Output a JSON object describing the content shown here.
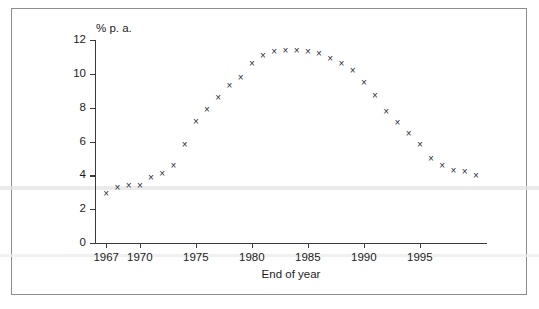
{
  "chart_data": {
    "type": "scatter",
    "title": "",
    "xlabel": "End of year",
    "ylabel": "% p. a.",
    "ylim": [
      0,
      12
    ],
    "xlim": [
      1966,
      2001
    ],
    "grid": false,
    "legend": null,
    "marker": "x",
    "marker_color": "#2b2b3a",
    "ytick_labels": [
      "0",
      "2",
      "4",
      "6",
      "8",
      "10",
      "12"
    ],
    "ytick_values": [
      0,
      2,
      4,
      6,
      8,
      10,
      12
    ],
    "xtick_labels": [
      "1967",
      "1970",
      "1975",
      "1980",
      "1985",
      "1990",
      "1995"
    ],
    "xtick_values": [
      1967,
      1970,
      1975,
      1980,
      1985,
      1990,
      1995
    ],
    "x": [
      1967,
      1968,
      1969,
      1970,
      1971,
      1972,
      1973,
      1974,
      1975,
      1976,
      1977,
      1978,
      1979,
      1980,
      1981,
      1982,
      1983,
      1984,
      1985,
      1986,
      1987,
      1988,
      1989,
      1990,
      1991,
      1992,
      1993,
      1994,
      1995,
      1996,
      1997,
      1998,
      1999,
      2000
    ],
    "values": [
      2.9,
      3.3,
      3.4,
      3.4,
      3.9,
      4.1,
      4.6,
      5.8,
      7.2,
      7.9,
      8.6,
      9.3,
      9.8,
      10.6,
      11.1,
      11.3,
      11.4,
      11.4,
      11.3,
      11.2,
      10.9,
      10.6,
      10.2,
      9.5,
      8.7,
      7.8,
      7.1,
      6.5,
      5.8,
      5.0,
      4.6,
      4.3,
      4.2,
      4.0
    ]
  },
  "colors": {
    "frame": "#8d8d8d",
    "axis": "#3a3a3a",
    "text": "#1c1c1c",
    "marker": "#2b2b3a",
    "background": "#ffffff"
  }
}
